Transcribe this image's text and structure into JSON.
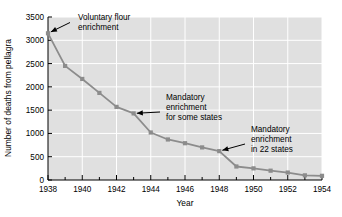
{
  "chart_data": {
    "type": "line",
    "title": "",
    "subtitle": "",
    "xlabel": "Year",
    "ylabel": "Number of deaths from pellagra",
    "xlim": [
      1938,
      1954
    ],
    "ylim": [
      0,
      3500
    ],
    "grid": true,
    "legend": "none",
    "x": [
      1938,
      1939,
      1940,
      1941,
      1942,
      1943,
      1944,
      1945,
      1946,
      1947,
      1948,
      1949,
      1950,
      1951,
      1952,
      1953,
      1954
    ],
    "values": [
      3150,
      2450,
      2170,
      1870,
      1570,
      1430,
      1020,
      870,
      790,
      700,
      620,
      290,
      250,
      200,
      160,
      100,
      90
    ],
    "series": [
      {
        "name": "Deaths from pellagra",
        "values": [
          3150,
          2450,
          2170,
          1870,
          1570,
          1430,
          1020,
          870,
          790,
          700,
          620,
          290,
          250,
          200,
          160,
          100,
          90
        ]
      }
    ],
    "xticks": [
      1938,
      1940,
      1942,
      1944,
      1946,
      1948,
      1950,
      1952,
      1954
    ],
    "xticklabels": [
      "1938",
      "1940",
      "1942",
      "1944",
      "1946",
      "1948",
      "1950",
      "1952",
      "1954"
    ],
    "xminorticks": [
      1939,
      1941,
      1943,
      1945,
      1947,
      1949,
      1951,
      1953
    ],
    "yticks": [
      0,
      500,
      1000,
      1500,
      2000,
      2500,
      3000,
      3500
    ],
    "yticklabels": [
      "0",
      "500",
      "1000",
      "1500",
      "2000",
      "2500",
      "3000",
      "3500"
    ],
    "annotations": [
      {
        "id": "voluntary-flour-enrichment",
        "lines": [
          "Voluntary flour",
          "enrichment"
        ],
        "points_to_x": 1938,
        "points_to_y": 3150
      },
      {
        "id": "mandatory-enrichment-some-states",
        "lines": [
          "Mandatory",
          "enrichment",
          "for some states"
        ],
        "points_to_x": 1943,
        "points_to_y": 1430
      },
      {
        "id": "mandatory-enrichment-22-states",
        "lines": [
          "Mandatory",
          "enrichment",
          "in 22 states"
        ],
        "points_to_x": 1948,
        "points_to_y": 620
      }
    ],
    "colors": {
      "line": "#8c8c8c",
      "marker": "#8c8c8c",
      "plot_background": "#e0e0e0",
      "gridline": "#ffffff",
      "axis": "#000000",
      "text": "#000000",
      "figure_background": "#ffffff"
    }
  }
}
